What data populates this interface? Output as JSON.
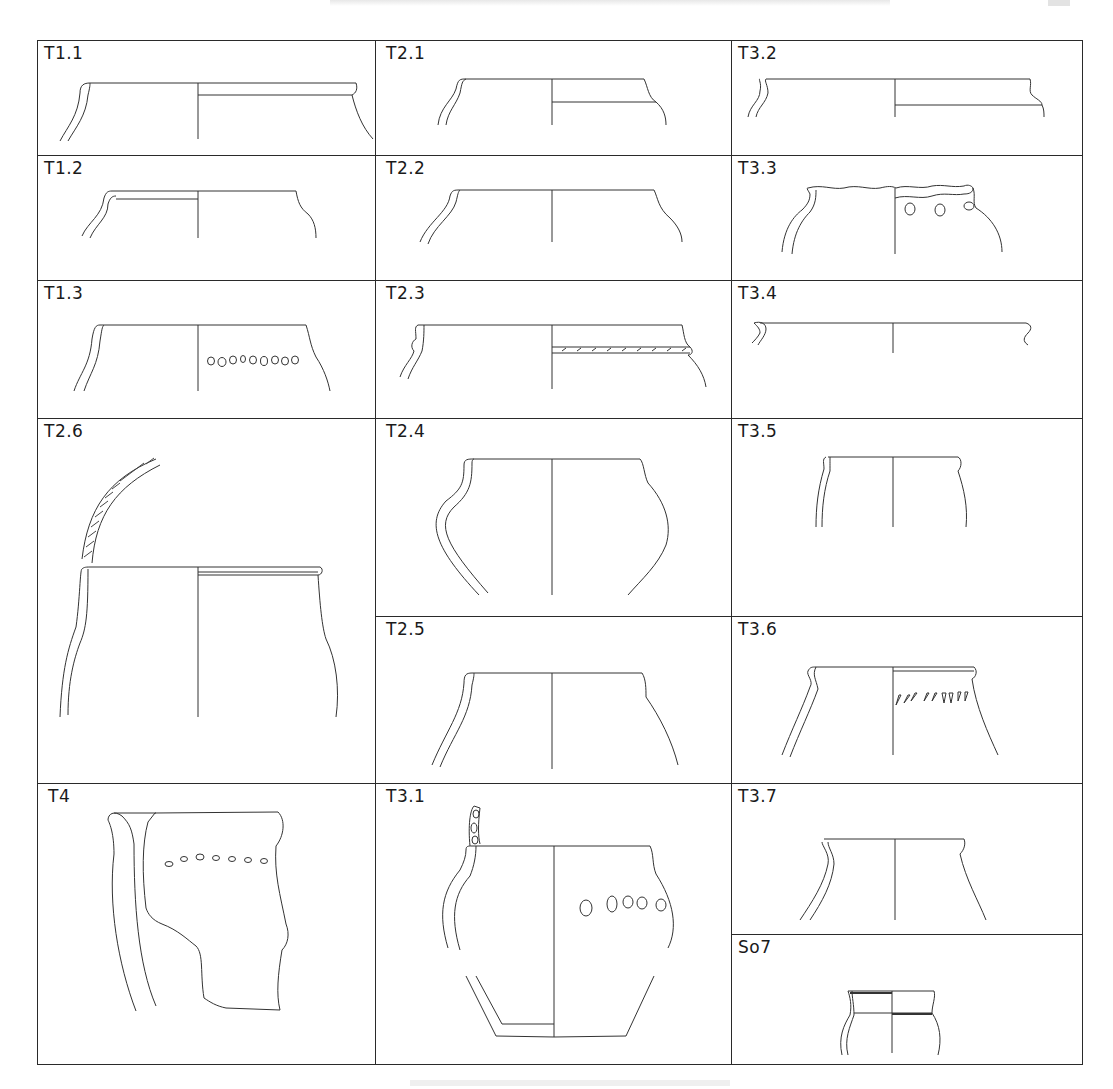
{
  "page": {
    "running_head": "",
    "page_number": "",
    "caption": ""
  },
  "plate": {
    "title": "Pottery typology plate – rim and vessel profiles",
    "cells": [
      {
        "id": "T1.1",
        "label": "T1.1",
        "column": 1,
        "row_span": "1"
      },
      {
        "id": "T1.2",
        "label": "T1.2",
        "column": 1,
        "row_span": "1"
      },
      {
        "id": "T1.3",
        "label": "T1.3",
        "column": 1,
        "row_span": "1"
      },
      {
        "id": "T2.6",
        "label": "T2.6",
        "column": 1,
        "row_span": "2"
      },
      {
        "id": "T4",
        "label": "T4",
        "column": 1,
        "row_span": "1"
      },
      {
        "id": "T2.1",
        "label": "T2.1",
        "column": 2,
        "row_span": "1"
      },
      {
        "id": "T2.2",
        "label": "T2.2",
        "column": 2,
        "row_span": "1"
      },
      {
        "id": "T2.3",
        "label": "T2.3",
        "column": 2,
        "row_span": "1"
      },
      {
        "id": "T2.4",
        "label": "T2.4",
        "column": 2,
        "row_span": "1"
      },
      {
        "id": "T2.5",
        "label": "T2.5",
        "column": 2,
        "row_span": "1"
      },
      {
        "id": "T3.1",
        "label": "T3.1",
        "column": 2,
        "row_span": "1"
      },
      {
        "id": "T3.2",
        "label": "T3.2",
        "column": 3,
        "row_span": "1"
      },
      {
        "id": "T3.3",
        "label": "T3.3",
        "column": 3,
        "row_span": "1"
      },
      {
        "id": "T3.4",
        "label": "T3.4",
        "column": 3,
        "row_span": "1"
      },
      {
        "id": "T3.5",
        "label": "T3.5",
        "column": 3,
        "row_span": "1"
      },
      {
        "id": "T3.6",
        "label": "T3.6",
        "column": 3,
        "row_span": "1"
      },
      {
        "id": "T3.7",
        "label": "T3.7",
        "column": 3,
        "row_span": "1"
      },
      {
        "id": "So7",
        "label": "So7",
        "column": 3,
        "row_span": "1"
      }
    ]
  },
  "colors": {
    "line": "#333333",
    "border": "#2a2a2a",
    "background": "#ffffff"
  }
}
